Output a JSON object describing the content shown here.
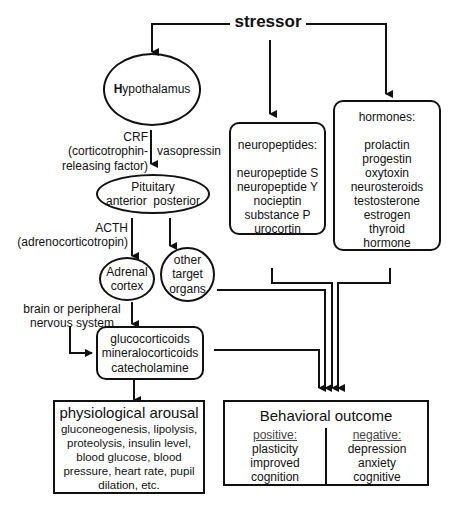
{
  "stressor": {
    "label": "stressor"
  },
  "hypothalamus": {
    "initial": "H",
    "rest": "ypothalamus"
  },
  "crf": {
    "line1": "CRF",
    "line2": "(corticotrophin-",
    "line3": "releasing factor)"
  },
  "vasopressin": {
    "label": "vasopressin"
  },
  "pituitary": {
    "title": "Pituitary",
    "anterior": "anterior",
    "posterior": "posterior"
  },
  "acth": {
    "line1": "ACTH",
    "line2": "(adrenocorticotropin)"
  },
  "adrenal": {
    "line1": "Adrenal",
    "line2": "cortex"
  },
  "other_target": {
    "line1": "other",
    "line2": "target",
    "line3": "organs"
  },
  "brain_nervous": {
    "line1": "brain or peripheral",
    "line2": "nervous system"
  },
  "hormones_out": {
    "items": [
      "glucocorticoids",
      "mineralocorticoids",
      "catecholamine"
    ]
  },
  "neuropeptides": {
    "title": "neuropeptides:",
    "items": [
      "neuropeptide S",
      "neuropeptide Y",
      "nocieptin",
      "substance P",
      "urocortin"
    ]
  },
  "hormones": {
    "title": "hormones:",
    "items": [
      "prolactin",
      "progestin",
      "oxytoxin",
      "neurosteroids",
      "testosterone",
      "estrogen",
      "thyroid",
      "hormone"
    ]
  },
  "physiological": {
    "title": "physiological arousal",
    "lines": [
      "gluconeogenesis, lipolysis,",
      "proteolysis, insulin level,",
      "blood glucose, blood",
      "pressure, heart rate, pupil",
      "dilation, etc."
    ]
  },
  "behavioral": {
    "title": "Behavioral outcome",
    "positive": {
      "heading": "positive:",
      "items": [
        "plasticity",
        "improved",
        "cognition"
      ]
    },
    "negative": {
      "heading": "negative:",
      "items": [
        "depression",
        "anxiety",
        "cognitive"
      ]
    }
  }
}
